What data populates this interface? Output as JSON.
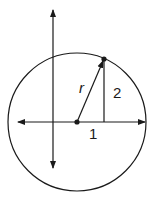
{
  "diagram": {
    "colors": {
      "stroke": "#1a1a1a",
      "background": "#ffffff"
    },
    "circle": {
      "cx": 77,
      "cy": 122,
      "r": 69
    },
    "axes": {
      "x_axis": {
        "x1": 18,
        "x2": 145,
        "y": 122,
        "arrows": "both"
      },
      "y_axis": {
        "x": 53,
        "y1": 10,
        "y2": 168,
        "arrows": "both"
      }
    },
    "center_point": {
      "x": 77,
      "y": 122
    },
    "circle_point": {
      "x": 104,
      "y": 59
    },
    "radius_segment": {
      "from": "center_point",
      "to": "circle_point",
      "arrow": "end"
    },
    "vertical_leg": {
      "x": 104,
      "y1": 59,
      "y2": 122
    },
    "labels": {
      "radius": {
        "text": "r",
        "x": 82,
        "y": 93
      },
      "vertical_leg": {
        "text": "2",
        "x": 118,
        "y": 98
      },
      "horizontal_leg": {
        "text": "1",
        "x": 93,
        "y": 139
      }
    }
  }
}
